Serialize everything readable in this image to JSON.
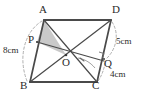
{
  "figure": {
    "type": "geometry-diagram",
    "shape": "parallelogram",
    "caption": "",
    "colors": {
      "stroke": "#4a4a4a",
      "shade_fill": "#c9c9c9",
      "dash": "#9a9a9a",
      "text": "#2b2b2b"
    },
    "vertices": [
      {
        "name": "A",
        "label": "A",
        "x": 44,
        "y": 20
      },
      {
        "name": "D",
        "label": "D",
        "x": 111,
        "y": 20
      },
      {
        "name": "B",
        "label": "B",
        "x": 30,
        "y": 82
      },
      {
        "name": "C",
        "label": "C",
        "x": 97,
        "y": 82
      },
      {
        "name": "O",
        "label": "O",
        "x": 66,
        "y": 55
      },
      {
        "name": "P",
        "label": "P",
        "x": 37,
        "y": 42
      },
      {
        "name": "Q",
        "label": "Q",
        "x": 104,
        "y": 61
      }
    ],
    "labels": {
      "A": "A",
      "B": "B",
      "C": "C",
      "D": "D",
      "O": "O",
      "P": "P",
      "Q": "Q"
    },
    "measurements": [
      {
        "name": "side-AB",
        "value": "8 cm",
        "text": "8cm"
      },
      {
        "name": "segment-DQ",
        "value": "5 cm",
        "text": "5cm"
      },
      {
        "name": "segment-QC",
        "value": "4 cm",
        "text": "4cm"
      }
    ],
    "measure_text": {
      "ab": "8cm",
      "dq": "5cm",
      "qc": "4cm"
    },
    "segments": [
      {
        "name": "side-AD",
        "from": "A",
        "to": "D"
      },
      {
        "name": "side-BC",
        "from": "B",
        "to": "C"
      },
      {
        "name": "side-AB",
        "from": "A",
        "to": "B"
      },
      {
        "name": "side-DC",
        "from": "D",
        "to": "C"
      },
      {
        "name": "diagonal-AC",
        "from": "A",
        "to": "C"
      },
      {
        "name": "diagonal-BD",
        "from": "B",
        "to": "D"
      },
      {
        "name": "segment-PQ",
        "from": "P",
        "to": "Q"
      },
      {
        "name": "segment-OC",
        "from": "O",
        "to": "C"
      }
    ],
    "shaded_region": {
      "name": "triangle-APO",
      "points": "A,P,O"
    },
    "markers": [
      {
        "name": "right-angle-at-Q",
        "type": "right-angle"
      },
      {
        "name": "angle-arc-at-O",
        "type": "arc"
      }
    ],
    "dashed_arcs": [
      {
        "name": "arc-left-AB",
        "describes": "8cm"
      },
      {
        "name": "arc-right-DQ",
        "describes": "5cm"
      },
      {
        "name": "arc-right-QC",
        "describes": "4cm"
      }
    ]
  }
}
